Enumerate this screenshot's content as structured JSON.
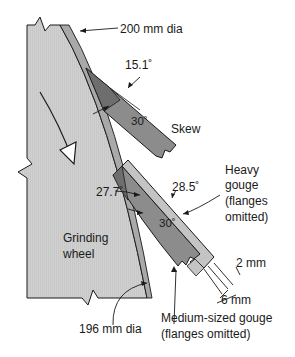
{
  "diagram": {
    "labels": {
      "outer_diameter": "200 mm dia",
      "inner_diameter": "196 mm dia",
      "wheel": [
        "Grinding",
        "wheel"
      ],
      "skew": "Skew",
      "heavy_gouge": [
        "Heavy",
        "gouge",
        "(flanges",
        "omitted)"
      ],
      "medium_gouge": [
        "Medium-sized gouge",
        "(flanges omitted)"
      ],
      "dim_2mm": "2 mm",
      "dim_6mm": "6 mm"
    },
    "angles": {
      "skew_contact": "15.1˚",
      "skew_bevel": "30˚",
      "medium_gouge_contact": "27.7˚",
      "heavy_gouge_contact": "28.5˚",
      "gouge_bevel": "30˚"
    },
    "colors": {
      "wheel_fill": "#cfcfcf",
      "rim_band": "#a9a9a9",
      "tool_dark": "#6e6e6e",
      "tool_mid": "#8c8c8c",
      "tool_light": "#c4c4c4",
      "outline": "#1a1a1a"
    }
  }
}
